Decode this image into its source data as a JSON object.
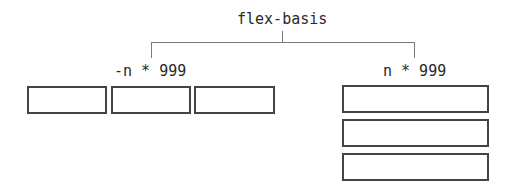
{
  "diagram": {
    "title": "flex-basis",
    "branches": [
      {
        "label": "-n * 999",
        "layout": "row",
        "box_count": 3
      },
      {
        "label": "n * 999",
        "layout": "column",
        "box_count": 3
      }
    ]
  },
  "colors": {
    "line": "#7a7a7a",
    "box_border": "#444444",
    "text": "#2a2a2a",
    "background": "#ffffff"
  }
}
